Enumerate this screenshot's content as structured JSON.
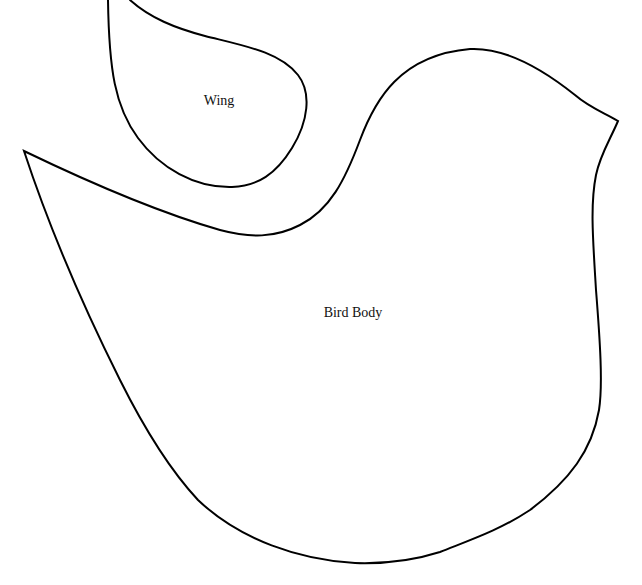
{
  "pattern": {
    "pieces": [
      {
        "id": "wing",
        "label": "Wing"
      },
      {
        "id": "body",
        "label": "Bird Body"
      }
    ],
    "colors": {
      "background": "#ffffff",
      "outline": "#000000",
      "text": "#111111"
    }
  }
}
